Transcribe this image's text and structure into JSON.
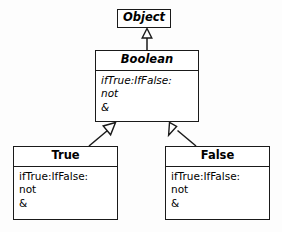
{
  "diagram": {
    "type": "uml-class-diagram",
    "colors": {
      "background": "#fdfdfd",
      "box_fill": "#ffffff",
      "stroke": "#1a1a1a",
      "text": "#000000"
    },
    "classes": [
      {
        "id": "object",
        "name": "Object",
        "abstract": true,
        "members": []
      },
      {
        "id": "boolean",
        "name": "Boolean",
        "abstract": true,
        "members": [
          "ifTrue:IfFalse:",
          "not",
          "&"
        ]
      },
      {
        "id": "true",
        "name": "True",
        "abstract": false,
        "members": [
          "ifTrue:IfFalse:",
          "not",
          "&"
        ]
      },
      {
        "id": "false",
        "name": "False",
        "abstract": false,
        "members": [
          "ifTrue:IfFalse:",
          "not",
          "&"
        ]
      }
    ],
    "relations": [
      {
        "kind": "generalization",
        "from": "Boolean",
        "to": "Object"
      },
      {
        "kind": "generalization",
        "from": "True",
        "to": "Boolean"
      },
      {
        "kind": "generalization",
        "from": "False",
        "to": "Boolean"
      }
    ]
  }
}
